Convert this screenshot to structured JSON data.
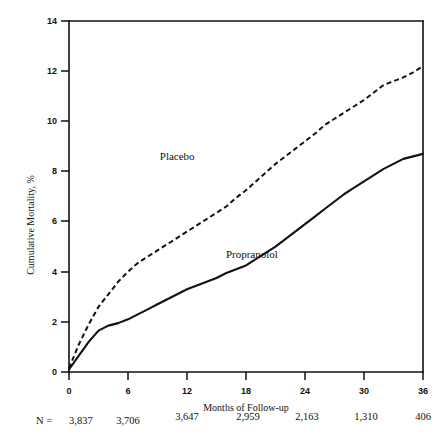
{
  "chart_data": {
    "type": "line",
    "title": "",
    "xlabel": "Months of Follow-up",
    "ylabel": "Cumulative Mortality, %",
    "xlim": [
      0,
      36
    ],
    "ylim": [
      0,
      14
    ],
    "grid": false,
    "legend_position": "inline-annotation",
    "xticks": [
      "0",
      "6",
      "12",
      "18",
      "24",
      "30",
      "36"
    ],
    "xtick_values": [
      0,
      6,
      12,
      18,
      24,
      30,
      36
    ],
    "yticks": [
      "0",
      "2",
      "4",
      "6",
      "8",
      "10",
      "12",
      "14"
    ],
    "ytick_values": [
      0,
      2,
      4,
      6,
      8,
      10,
      12,
      14
    ],
    "x": [
      0,
      1,
      2,
      3,
      4,
      5,
      6,
      7,
      8,
      9,
      10,
      11,
      12,
      13,
      14,
      15,
      16,
      17,
      18,
      19,
      20,
      21,
      22,
      23,
      24,
      25,
      26,
      27,
      28,
      29,
      30,
      31,
      32,
      33,
      34,
      35,
      36
    ],
    "series": [
      {
        "name": "Placebo",
        "style": "dashed",
        "label_x_month": 11.0,
        "label_y_value": 8.45,
        "values": [
          0.15,
          1.1,
          1.9,
          2.6,
          3.1,
          3.6,
          4.0,
          4.35,
          4.6,
          4.85,
          5.1,
          5.35,
          5.6,
          5.85,
          6.1,
          6.35,
          6.6,
          6.95,
          7.25,
          7.6,
          7.95,
          8.3,
          8.6,
          8.9,
          9.2,
          9.5,
          9.85,
          10.1,
          10.35,
          10.6,
          10.85,
          11.15,
          11.45,
          11.6,
          11.75,
          11.95,
          12.2
        ]
      },
      {
        "name": "Propranolol",
        "style": "solid",
        "label_x_month": 18.6,
        "label_y_value": 4.55,
        "values": [
          0.1,
          0.65,
          1.2,
          1.65,
          1.85,
          1.95,
          2.1,
          2.3,
          2.5,
          2.7,
          2.9,
          3.1,
          3.3,
          3.45,
          3.6,
          3.75,
          3.95,
          4.1,
          4.25,
          4.5,
          4.75,
          5.0,
          5.3,
          5.6,
          5.9,
          6.2,
          6.5,
          6.8,
          7.1,
          7.35,
          7.6,
          7.85,
          8.1,
          8.3,
          8.5,
          8.6,
          8.7
        ]
      }
    ],
    "n_row": {
      "prefix": "N =",
      "values": [
        "3,837",
        "3,706",
        "3,647",
        "2,959",
        "2,163",
        "1,310",
        "406"
      ]
    }
  }
}
